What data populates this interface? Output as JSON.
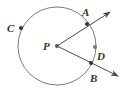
{
  "diagram": {
    "type": "geometry",
    "circle": {
      "center_label": "P",
      "cx": 57,
      "cy": 46,
      "r": 39,
      "stroke": "#7a7a7a"
    },
    "center": {
      "label": "P",
      "x": 57,
      "y": 46,
      "label_x": 43,
      "label_y": 50
    },
    "points": [
      {
        "label": "A",
        "x": 87,
        "y": 24,
        "label_x": 82,
        "label_y": 16
      },
      {
        "label": "C",
        "x": 21,
        "y": 28,
        "label_x": 7,
        "label_y": 32
      },
      {
        "label": "D",
        "x": 95,
        "y": 47,
        "label_x": 97,
        "label_y": 60
      },
      {
        "label": "B",
        "x": 91,
        "y": 63,
        "label_x": 90,
        "label_y": 82
      }
    ],
    "rays": [
      {
        "name": "ray-PA",
        "from": "P",
        "through": "A",
        "x1": 57,
        "y1": 46,
        "x2": 110,
        "y2": 12
      },
      {
        "name": "ray-PB",
        "from": "P",
        "through": "B",
        "x1": 57,
        "y1": 46,
        "x2": 118,
        "y2": 76
      }
    ],
    "colors": {
      "line": "#4a4a4a",
      "circle": "#7a7a7a",
      "point": "#333333",
      "label": "#333333"
    }
  }
}
